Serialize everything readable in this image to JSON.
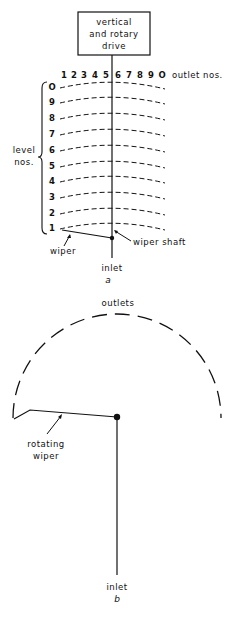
{
  "diagram_a": {
    "drive_box": {
      "line1": "vertical",
      "line2": "and rotary",
      "line3": "drive"
    },
    "outlet_numbers": [
      "1",
      "2",
      "3",
      "4",
      "5",
      "6",
      "7",
      "8",
      "9",
      "O"
    ],
    "outlet_label": "outlet nos.",
    "level_numbers": [
      "O",
      "9",
      "8",
      "7",
      "6",
      "5",
      "4",
      "3",
      "2",
      "1"
    ],
    "level_label_line1": "level",
    "level_label_line2": "nos.",
    "wiper_label": "wiper",
    "wiper_shaft_label": "wiper shaft",
    "inlet_label": "inlet",
    "caption": "a"
  },
  "diagram_b": {
    "outlets_label": "outlets",
    "rotating_wiper_line1": "rotating",
    "rotating_wiper_line2": "wiper",
    "inlet_label": "inlet",
    "caption": "b"
  }
}
